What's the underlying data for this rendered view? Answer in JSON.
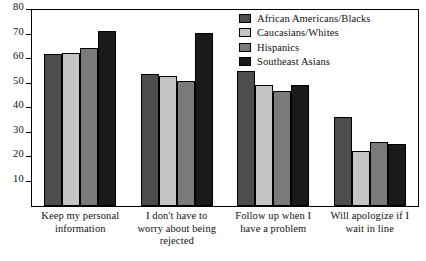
{
  "chart_data": {
    "type": "bar",
    "title": "",
    "subtitle": "",
    "xlabel": "",
    "ylabel": "",
    "ylim": [
      0,
      80
    ],
    "yticks": [
      10,
      20,
      30,
      40,
      50,
      60,
      70,
      80
    ],
    "grid": false,
    "legend_position": "top-right",
    "categories": [
      "Keep my personal information",
      "I don't have to worry about being rejected",
      "Follow up when I have a problem",
      "Will apologize if I wait in line"
    ],
    "category_lines": [
      [
        "Keep my personal",
        "information"
      ],
      [
        "I don't have to",
        "worry about being",
        "rejected"
      ],
      [
        "Follow up when I",
        "have a problem"
      ],
      [
        "Will apologize if I",
        "wait in line"
      ]
    ],
    "series": [
      {
        "name": "African Americans/Blacks",
        "color": "#4d4d4d",
        "values": [
          62,
          54,
          55,
          36.5
        ]
      },
      {
        "name": "Caucasians/Whites",
        "color": "#c4c4c4",
        "values": [
          62.5,
          53,
          49.5,
          22.5
        ]
      },
      {
        "name": "Hispanics",
        "color": "#7a7a7a",
        "values": [
          64.5,
          51,
          47,
          26
        ]
      },
      {
        "name": "Southeast Asians",
        "color": "#1a1a1a",
        "values": [
          71.5,
          70.5,
          49.5,
          25.5
        ]
      }
    ]
  }
}
